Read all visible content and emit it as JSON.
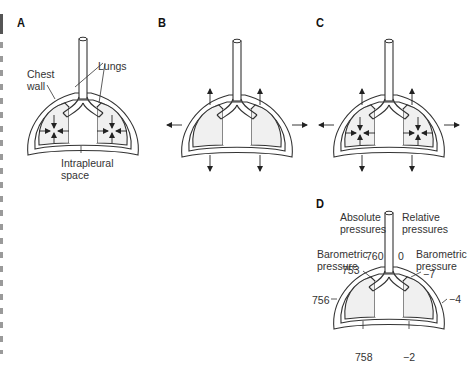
{
  "panels": {
    "A": {
      "letter": "A",
      "labels": {
        "chest_wall_1": "Chest",
        "chest_wall_2": "wall",
        "lungs": "Lungs",
        "intrapleural_1": "Intrapleural",
        "intrapleural_2": "space"
      },
      "arrows": "inward (lungs recoil inward)"
    },
    "B": {
      "letter": "B",
      "arrows": "outward (chest wall recoils outward)"
    },
    "C": {
      "letter": "C",
      "arrows": "inward lungs + outward chest wall"
    },
    "D": {
      "letter": "D",
      "labels": {
        "absolute_1": "Absolute",
        "absolute_2": "pressures",
        "relative_1": "Relative",
        "relative_2": "pressures",
        "baro_left_1": "Barometric",
        "baro_left_2": "pressure",
        "baro_right_1": "Barometric",
        "baro_right_2": "pressure"
      },
      "absolute_values": {
        "airway": "760",
        "apex": "753",
        "side": "756",
        "base": "758"
      },
      "relative_values": {
        "airway": "0",
        "apex": "−7",
        "side": "−4",
        "base": "−2"
      }
    }
  },
  "colors": {
    "stroke": "#333333",
    "lung_fill": "#f0f0f0",
    "background": "#ffffff"
  }
}
